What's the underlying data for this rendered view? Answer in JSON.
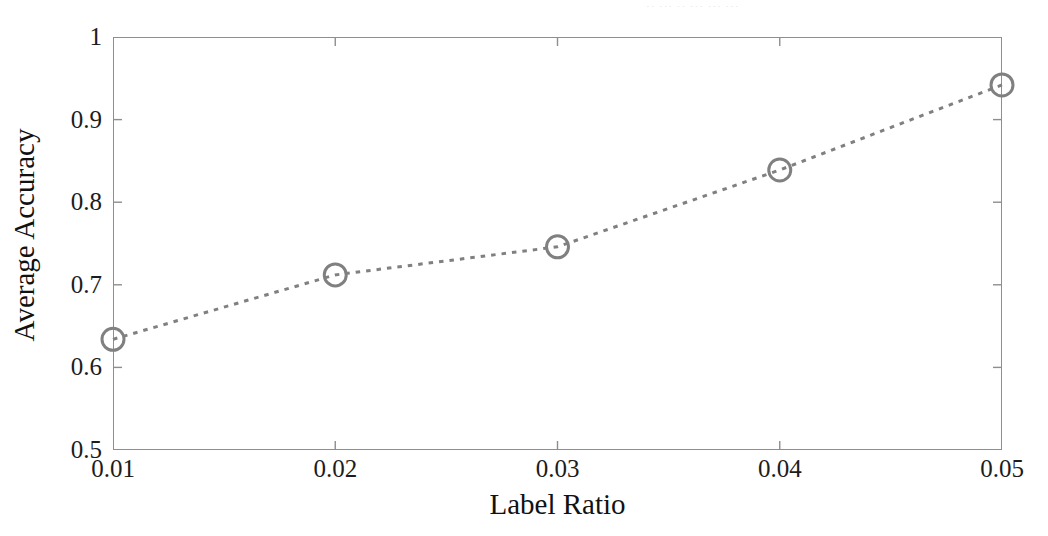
{
  "figure": {
    "background_color": "#ffffff",
    "top_artifact_text": "·· ··· ·· ··· ··· ···"
  },
  "axes": {
    "frame_color": "#8e8e8e",
    "x_tick_labels": [
      "0.01",
      "0.02",
      "0.03",
      "0.04",
      "0.05"
    ],
    "y_tick_labels": [
      "0.5",
      "0.6",
      "0.7",
      "0.8",
      "0.9",
      "1"
    ],
    "x_title": "Label Ratio",
    "y_title": "Average Accuracy"
  },
  "chart_data": {
    "type": "line",
    "title": "",
    "xlabel": "Label Ratio",
    "ylabel": "Average Accuracy",
    "xlim": [
      0.01,
      0.05
    ],
    "ylim": [
      0.5,
      1.0
    ],
    "xticks": [
      0.01,
      0.02,
      0.03,
      0.04,
      0.05
    ],
    "yticks": [
      0.5,
      0.6,
      0.7,
      0.8,
      0.9,
      1.0
    ],
    "grid": false,
    "legend": null,
    "series": [
      {
        "name": "Average Accuracy",
        "color": "#808080",
        "linestyle": "dotted",
        "linewidth": 3,
        "marker": "circle-open",
        "marker_size": 11,
        "x": [
          0.01,
          0.02,
          0.03,
          0.04,
          0.05
        ],
        "values": [
          0.634,
          0.712,
          0.746,
          0.839,
          0.942
        ]
      }
    ]
  }
}
